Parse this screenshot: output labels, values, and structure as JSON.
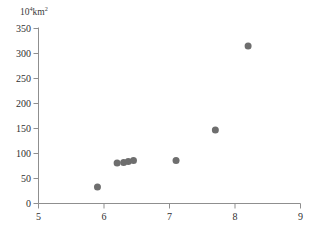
{
  "chart_data": {
    "type": "scatter",
    "title": "",
    "subtitle": "",
    "ylabel": "10⁴km²",
    "ylabel_base": "10",
    "ylabel_exp": "4",
    "ylabel_rest": "km",
    "ylabel_rest_exp": "2",
    "xlabel": "",
    "xlim": [
      5,
      9
    ],
    "ylim": [
      0,
      350
    ],
    "xticks": [
      5,
      6,
      7,
      8,
      9
    ],
    "yticks": [
      0,
      50,
      100,
      150,
      200,
      250,
      300,
      350
    ],
    "xtick_labels": [
      "5",
      "6",
      "7",
      "8",
      "9"
    ],
    "ytick_labels": [
      "0",
      "50",
      "100",
      "150",
      "200",
      "250",
      "300",
      "350"
    ],
    "grid": false,
    "legend": false,
    "legend_position": "none",
    "marker": "circle",
    "marker_color": "#6e6e6e",
    "marker_size": 7,
    "axis_color": "#8a8a8a",
    "text_color": "#2f2f2f",
    "points": [
      {
        "x": 5.9,
        "y": 33
      },
      {
        "x": 6.2,
        "y": 81
      },
      {
        "x": 6.3,
        "y": 82
      },
      {
        "x": 6.37,
        "y": 84
      },
      {
        "x": 6.45,
        "y": 86
      },
      {
        "x": 7.1,
        "y": 86
      },
      {
        "x": 7.7,
        "y": 147
      },
      {
        "x": 8.2,
        "y": 315
      }
    ]
  },
  "caption": {
    "sliver_text": ""
  }
}
